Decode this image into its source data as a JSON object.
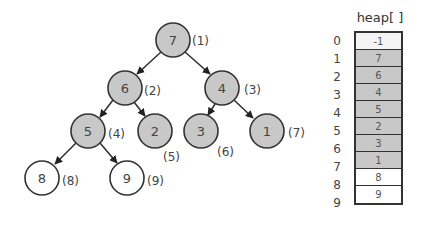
{
  "colors": {
    "filled_node": "#c8c8c8",
    "empty_node": "#ffffff",
    "stroke": "#333333",
    "filled_cell": "#c8c8c8",
    "empty_cell": "#ffffff",
    "first_cell": "#f4f4f4"
  },
  "tree": {
    "nodes": [
      {
        "value": "7",
        "index": "(1)",
        "filled": true
      },
      {
        "value": "6",
        "index": "(2)",
        "filled": true
      },
      {
        "value": "4",
        "index": "(3)",
        "filled": true
      },
      {
        "value": "5",
        "index": "(4)",
        "filled": true
      },
      {
        "value": "2",
        "index": "(5)",
        "filled": true
      },
      {
        "value": "3",
        "index": "(6)",
        "filled": true
      },
      {
        "value": "1",
        "index": "(7)",
        "filled": true
      },
      {
        "value": "8",
        "index": "(8)",
        "filled": false
      },
      {
        "value": "9",
        "index": "(9)",
        "filled": false
      }
    ],
    "edges": [
      [
        1,
        2
      ],
      [
        1,
        3
      ],
      [
        2,
        4
      ],
      [
        2,
        5
      ],
      [
        3,
        6
      ],
      [
        3,
        7
      ],
      [
        4,
        8
      ],
      [
        4,
        9
      ]
    ]
  },
  "heap": {
    "title": "heap[ ]",
    "indices": [
      "0",
      "1",
      "2",
      "3",
      "4",
      "5",
      "6",
      "7",
      "8",
      "9"
    ],
    "values": [
      "-1",
      "7",
      "6",
      "4",
      "5",
      "2",
      "3",
      "1",
      "8",
      "9"
    ]
  }
}
